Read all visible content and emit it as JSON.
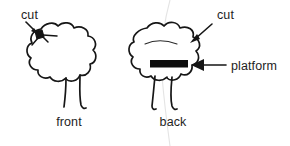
{
  "figure": {
    "background_color": "#ffffff",
    "ink_color": "#161616",
    "platform_color": "#0d0d0d",
    "crease_color": "#e4e4e4",
    "width": 290,
    "height": 146
  },
  "panels": [
    {
      "id": "front-view",
      "caption": "front",
      "caption_x": 69,
      "caption_y": 126,
      "annotations": [
        {
          "id": "cut-left",
          "label": "cut",
          "label_x": 21,
          "label_y": 19,
          "arrow_from_x": 27,
          "arrow_from_y": 22,
          "arrow_to_x": 38,
          "arrow_to_y": 34
        }
      ]
    },
    {
      "id": "back-view",
      "caption": "back",
      "caption_x": 152,
      "caption_y": 126,
      "annotations": [
        {
          "id": "cut-right",
          "label": "cut",
          "label_x": 217,
          "label_y": 19,
          "arrow_from_x": 212,
          "arrow_from_y": 24,
          "arrow_to_x": 190,
          "arrow_to_y": 42
        },
        {
          "id": "platform",
          "label": "platform",
          "label_x": 231,
          "label_y": 70,
          "arrow_from_x": 226,
          "arrow_from_y": 65,
          "arrow_to_x": 192,
          "arrow_to_y": 65
        }
      ]
    }
  ],
  "platform": {
    "label": "platform",
    "x": 150,
    "y": 60,
    "width": 38,
    "height": 7.5
  }
}
